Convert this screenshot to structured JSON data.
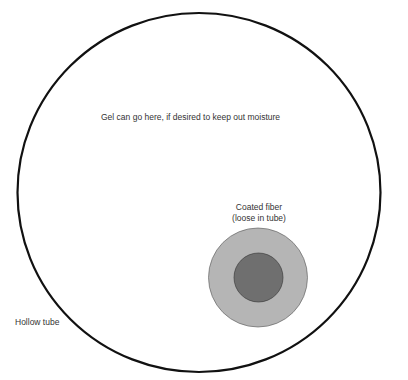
{
  "diagram": {
    "labels": {
      "gel": "Gel can go here, if desired to keep out moisture",
      "fiber_line1": "Coated fiber",
      "fiber_line2": "(loose in tube)",
      "tube": "Hollow tube"
    },
    "colors": {
      "tube_stroke": "#111111",
      "coating_fill": "#b5b5b5",
      "core_fill": "#6f6f6f",
      "text": "#333333"
    }
  }
}
